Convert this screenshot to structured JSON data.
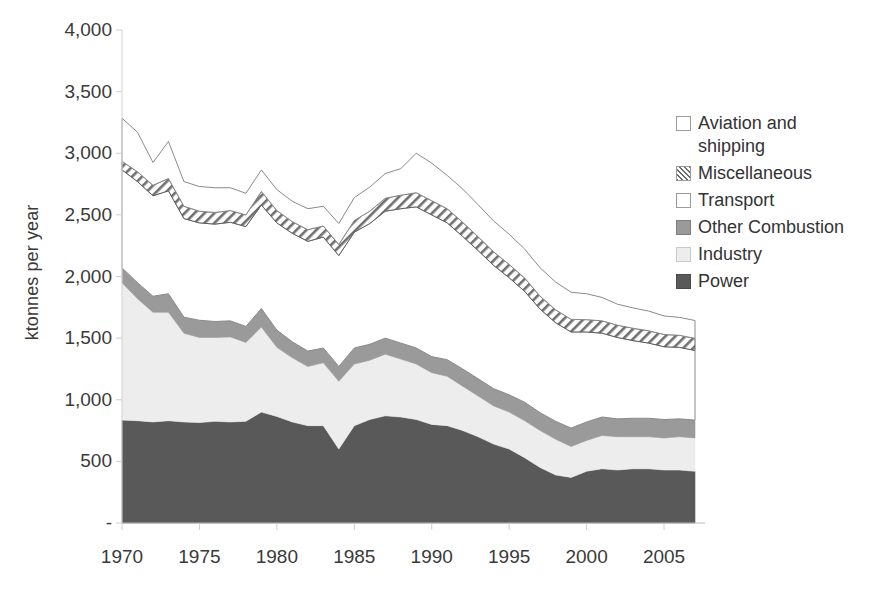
{
  "chart_data": {
    "type": "area",
    "stacked": true,
    "title": "",
    "subtitle": "",
    "xlabel": "",
    "ylabel": "ktonnes per year",
    "xlim": [
      1970,
      2007
    ],
    "ylim": [
      0,
      4000
    ],
    "grid": false,
    "legend_position": "right",
    "x_ticks": [
      "1970",
      "1975",
      "1980",
      "1985",
      "1990",
      "1995",
      "2000",
      "2005"
    ],
    "x_tick_values": [
      1970,
      1975,
      1980,
      1985,
      1990,
      1995,
      2000,
      2005
    ],
    "y_ticks": [
      "-",
      "500",
      "1,000",
      "1,500",
      "2,000",
      "2,500",
      "3,000",
      "3,500",
      "4,000"
    ],
    "y_tick_values": [
      0,
      500,
      1000,
      1500,
      2000,
      2500,
      3000,
      3500,
      4000
    ],
    "x": [
      1970,
      1971,
      1972,
      1973,
      1974,
      1975,
      1976,
      1977,
      1978,
      1979,
      1980,
      1981,
      1982,
      1983,
      1984,
      1985,
      1986,
      1987,
      1988,
      1989,
      1990,
      1991,
      1992,
      1993,
      1994,
      1995,
      1996,
      1997,
      1998,
      1999,
      2000,
      2001,
      2002,
      2003,
      2004,
      2005,
      2006,
      2007
    ],
    "series": [
      {
        "name": "Power",
        "order": 1,
        "color": "#595959",
        "pattern": "solid",
        "values": [
          835,
          830,
          820,
          830,
          820,
          815,
          825,
          820,
          825,
          900,
          865,
          820,
          790,
          790,
          600,
          790,
          840,
          870,
          860,
          840,
          800,
          790,
          750,
          700,
          640,
          600,
          530,
          450,
          390,
          370,
          420,
          440,
          430,
          440,
          440,
          430,
          430,
          420
        ]
      },
      {
        "name": "Industry",
        "order": 2,
        "color": "#ededed",
        "pattern": "solid",
        "values": [
          1115,
          990,
          890,
          880,
          720,
          690,
          680,
          690,
          640,
          690,
          560,
          520,
          480,
          510,
          550,
          500,
          480,
          500,
          470,
          450,
          420,
          400,
          360,
          330,
          310,
          300,
          300,
          300,
          290,
          250,
          250,
          270,
          270,
          260,
          260,
          260,
          270,
          270
        ]
      },
      {
        "name": "Other Combustion",
        "order": 3,
        "color": "#9a9a9a",
        "pattern": "solid",
        "values": [
          120,
          130,
          130,
          150,
          130,
          140,
          130,
          130,
          130,
          150,
          140,
          130,
          125,
          120,
          120,
          130,
          130,
          130,
          130,
          130,
          130,
          135,
          140,
          140,
          140,
          140,
          150,
          145,
          145,
          150,
          150,
          150,
          145,
          150,
          150,
          150,
          145,
          145
        ]
      },
      {
        "name": "Transport",
        "order": 4,
        "color": "#ffffff",
        "pattern": "solid",
        "values": [
          795,
          820,
          815,
          835,
          800,
          790,
          790,
          800,
          810,
          840,
          870,
          880,
          890,
          900,
          900,
          940,
          980,
          1030,
          1090,
          1145,
          1150,
          1110,
          1075,
          1040,
          1000,
          950,
          900,
          840,
          800,
          780,
          730,
          680,
          660,
          630,
          610,
          590,
          580,
          565
        ]
      },
      {
        "name": "Miscellaneous",
        "order": 5,
        "color": "#ffffff",
        "pattern": "hatch",
        "values": [
          70,
          80,
          85,
          100,
          100,
          95,
          95,
          95,
          95,
          110,
          100,
          95,
          95,
          90,
          90,
          95,
          100,
          105,
          110,
          115,
          115,
          115,
          115,
          112,
          110,
          108,
          108,
          105,
          105,
          102,
          100,
          100,
          100,
          100,
          100,
          100,
          98,
          98
        ]
      },
      {
        "name": "Aviation and shipping",
        "order": 6,
        "color": "#ffffff",
        "pattern": "solid",
        "values": [
          350,
          320,
          185,
          300,
          200,
          200,
          200,
          185,
          175,
          175,
          170,
          165,
          170,
          160,
          170,
          185,
          195,
          200,
          215,
          320,
          305,
          270,
          270,
          260,
          250,
          245,
          235,
          230,
          225,
          220,
          210,
          190,
          170,
          165,
          160,
          150,
          145,
          145
        ]
      }
    ]
  },
  "legend": {
    "items": [
      {
        "label": "Aviation and shipping",
        "swatch": "sw-white"
      },
      {
        "label": "Miscellaneous",
        "swatch": "sw-hatch"
      },
      {
        "label": "Transport",
        "swatch": "sw-white"
      },
      {
        "label": "Other Combustion",
        "swatch": "sw-mid"
      },
      {
        "label": "Industry",
        "swatch": "sw-light"
      },
      {
        "label": "Power",
        "swatch": "sw-dark"
      }
    ]
  }
}
